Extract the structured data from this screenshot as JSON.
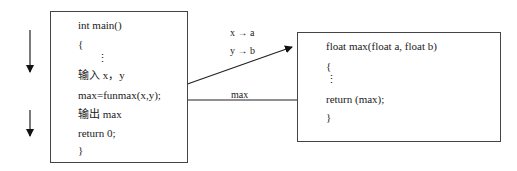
{
  "main_function": {
    "lines": [
      "int main()",
      "{",
      "⋮",
      "输入 x，y",
      "max=funmax(x,y);",
      "输出 max",
      "return 0;",
      "}"
    ]
  },
  "max_function": {
    "lines": [
      "float max(float a, float b)",
      "{",
      "⋮",
      "return (max);",
      "}"
    ]
  },
  "arrows": {
    "param_labels": [
      "x → a",
      "y → b"
    ],
    "return_label": "max"
  }
}
